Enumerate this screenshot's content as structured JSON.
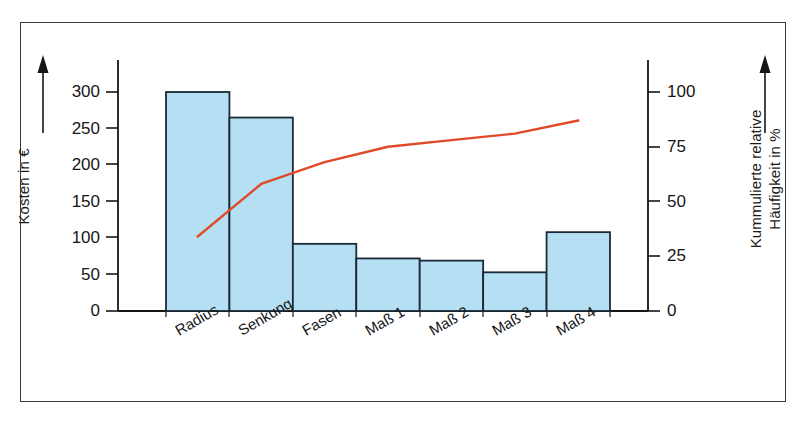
{
  "chart_data": {
    "type": "bar",
    "title": "",
    "subtitle": "",
    "xlabel": "",
    "ylabel": "Kosten in €",
    "ylabel_right": "Kummulierte relative Häufigkeit in %",
    "ylabel_right_line1": "Kummulierte relative",
    "ylabel_right_line2": "Häufigkeit in %",
    "categories": [
      "Radius",
      "Senkung",
      "Fasen",
      "Maß 1",
      "Maß 2",
      "Maß 3",
      "Maß 4"
    ],
    "series": [
      {
        "name": "Kosten",
        "type": "bar",
        "axis": "left",
        "unit": "€",
        "values": [
          300,
          265,
          92,
          72,
          69,
          53,
          108
        ]
      },
      {
        "name": "Kummulierte relative Häufigkeit",
        "type": "line",
        "axis": "right",
        "unit": "%",
        "values": [
          34,
          58,
          68,
          75,
          78,
          81,
          87
        ]
      }
    ],
    "ylim": [
      0,
      325
    ],
    "ylim_right": [
      0,
      108
    ],
    "yticks": [
      0,
      50,
      100,
      150,
      200,
      250,
      300
    ],
    "ytick_labels": [
      "0",
      "50",
      "100",
      "150",
      "200",
      "250",
      "300"
    ],
    "yticks_right": [
      0,
      25,
      50,
      75,
      100
    ],
    "ytick_labels_right": [
      "0",
      "25",
      "50",
      "75",
      "100"
    ],
    "grid": false,
    "legend": "none",
    "colors": {
      "bar_fill": "#b5dff3",
      "bar_edge": "#1b2a36",
      "line": "#e04a28",
      "axis": "#161616",
      "frame": "#3a3a3a",
      "text": "#161616",
      "background": "#ffffff"
    }
  }
}
